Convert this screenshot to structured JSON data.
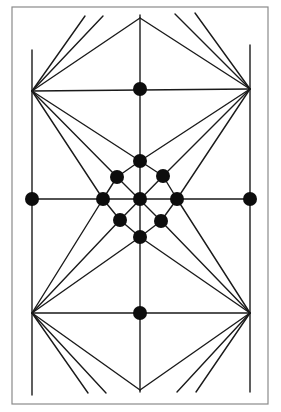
{
  "diagram": {
    "type": "geometric line figure",
    "colors": {
      "line": "#1a1a1a",
      "node": "#0d0d0d",
      "frame": "#8a8a8a",
      "background": "#ffffff"
    },
    "frame": {
      "x": 12,
      "y": 7,
      "width": 256,
      "height": 397
    },
    "apexes": {
      "top": [
        140,
        18
      ],
      "upper_left": [
        32,
        91
      ],
      "upper_right": [
        250,
        89
      ],
      "lower_left": [
        32,
        313
      ],
      "lower_right": [
        250,
        313
      ],
      "bottom": [
        140,
        390
      ]
    },
    "nodes": [
      {
        "id": "upper-mid-dot",
        "x": 140,
        "y": 89,
        "r": 7
      },
      {
        "id": "lattice-top",
        "x": 140,
        "y": 161,
        "r": 7
      },
      {
        "id": "lattice-upper-left",
        "x": 117,
        "y": 177,
        "r": 7
      },
      {
        "id": "lattice-upper-right",
        "x": 163,
        "y": 176,
        "r": 7
      },
      {
        "id": "lattice-left",
        "x": 103,
        "y": 199,
        "r": 7
      },
      {
        "id": "lattice-center",
        "x": 140,
        "y": 199,
        "r": 7
      },
      {
        "id": "lattice-right",
        "x": 177,
        "y": 199,
        "r": 7
      },
      {
        "id": "lattice-lower-left",
        "x": 120,
        "y": 220,
        "r": 7
      },
      {
        "id": "lattice-lower-right",
        "x": 161,
        "y": 221,
        "r": 7
      },
      {
        "id": "lattice-bottom",
        "x": 140,
        "y": 237,
        "r": 7
      },
      {
        "id": "left-edge-dot",
        "x": 32,
        "y": 199,
        "r": 7
      },
      {
        "id": "right-edge-dot",
        "x": 250,
        "y": 199,
        "r": 7
      },
      {
        "id": "lower-mid-dot",
        "x": 140,
        "y": 313,
        "r": 7
      }
    ],
    "lines": [
      {
        "id": "left-vertical",
        "p": [
          32,
          50,
          32,
          395
        ]
      },
      {
        "id": "right-vertical",
        "p": [
          250,
          45,
          250,
          392
        ]
      },
      {
        "id": "center-vertical",
        "p": [
          140,
          15,
          140,
          392
        ]
      },
      {
        "id": "upper-horizontal",
        "p": [
          32,
          91,
          250,
          89
        ]
      },
      {
        "id": "middle-horizontal",
        "p": [
          32,
          199,
          250,
          199
        ]
      },
      {
        "id": "lower-horizontal",
        "p": [
          32,
          313,
          250,
          313
        ]
      },
      {
        "id": "top-to-upper-left",
        "p": [
          140,
          18,
          32,
          91
        ]
      },
      {
        "id": "top-to-upper-right",
        "p": [
          140,
          18,
          250,
          89
        ]
      },
      {
        "id": "bottom-to-lower-left",
        "p": [
          140,
          390,
          32,
          313
        ]
      },
      {
        "id": "bottom-to-lower-right",
        "p": [
          140,
          390,
          250,
          313
        ]
      },
      {
        "id": "ul-fan-up-1",
        "p": [
          32,
          91,
          85,
          16
        ]
      },
      {
        "id": "ul-fan-up-2",
        "p": [
          32,
          91,
          103,
          16
        ]
      },
      {
        "id": "ur-fan-up-1",
        "p": [
          250,
          89,
          175,
          14
        ]
      },
      {
        "id": "ur-fan-up-2",
        "p": [
          250,
          89,
          195,
          13
        ]
      },
      {
        "id": "ll-fan-down-1",
        "p": [
          32,
          313,
          88,
          393
        ]
      },
      {
        "id": "ll-fan-down-2",
        "p": [
          32,
          313,
          106,
          393
        ]
      },
      {
        "id": "lr-fan-down-1",
        "p": [
          250,
          313,
          177,
          392
        ]
      },
      {
        "id": "lr-fan-down-2",
        "p": [
          250,
          313,
          196,
          392
        ]
      },
      {
        "id": "ul-to-lattice-top",
        "p": [
          32,
          91,
          140,
          161
        ]
      },
      {
        "id": "ul-to-lattice-upper-left",
        "p": [
          32,
          91,
          117,
          177
        ]
      },
      {
        "id": "ul-to-lattice-left",
        "p": [
          32,
          91,
          103,
          199
        ]
      },
      {
        "id": "ur-to-lattice-top",
        "p": [
          250,
          89,
          140,
          161
        ]
      },
      {
        "id": "ur-to-lattice-upper-right",
        "p": [
          250,
          89,
          163,
          176
        ]
      },
      {
        "id": "ur-to-lattice-right",
        "p": [
          250,
          89,
          177,
          199
        ]
      },
      {
        "id": "ll-to-lattice-bottom",
        "p": [
          32,
          313,
          140,
          237
        ]
      },
      {
        "id": "ll-to-lattice-lower-left",
        "p": [
          32,
          313,
          120,
          220
        ]
      },
      {
        "id": "ll-to-lattice-left",
        "p": [
          32,
          313,
          103,
          199
        ]
      },
      {
        "id": "lr-to-lattice-bottom",
        "p": [
          250,
          313,
          140,
          237
        ]
      },
      {
        "id": "lr-to-lattice-lower-right",
        "p": [
          250,
          313,
          161,
          221
        ]
      },
      {
        "id": "lr-to-lattice-right",
        "p": [
          250,
          313,
          177,
          199
        ]
      },
      {
        "id": "lattice-top-upper-left",
        "p": [
          140,
          161,
          117,
          177
        ]
      },
      {
        "id": "lattice-upper-left-left",
        "p": [
          117,
          177,
          103,
          199
        ]
      },
      {
        "id": "lattice-left-lower-left",
        "p": [
          103,
          199,
          120,
          220
        ]
      },
      {
        "id": "lattice-lower-left-bottom",
        "p": [
          120,
          220,
          140,
          237
        ]
      },
      {
        "id": "lattice-bottom-lower-right",
        "p": [
          140,
          237,
          161,
          221
        ]
      },
      {
        "id": "lattice-lower-right-right",
        "p": [
          161,
          221,
          177,
          199
        ]
      },
      {
        "id": "lattice-right-upper-right",
        "p": [
          177,
          199,
          163,
          176
        ]
      },
      {
        "id": "lattice-upper-right-top",
        "p": [
          163,
          176,
          140,
          161
        ]
      },
      {
        "id": "lattice-diag-ul-lr",
        "p": [
          117,
          177,
          161,
          221
        ]
      },
      {
        "id": "lattice-diag-ur-ll",
        "p": [
          163,
          176,
          120,
          220
        ]
      }
    ]
  }
}
